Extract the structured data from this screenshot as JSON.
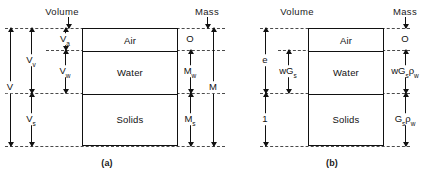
{
  "figure": {
    "caption_a": "(a)",
    "caption_b": "(b)"
  },
  "panel_a": {
    "header_volume": "Volume",
    "header_mass": "Mass",
    "phases": [
      {
        "name": "Air"
      },
      {
        "name": "Water"
      },
      {
        "name": "Solids"
      }
    ],
    "volume_labels": {
      "total": "V",
      "voids": "V",
      "voids_sub": "v",
      "air": "V",
      "air_sub": "a",
      "water": "V",
      "water_sub": "w",
      "solids": "V",
      "solids_sub": "s"
    },
    "mass_labels": {
      "air": "O",
      "water": "M",
      "water_sub": "w",
      "solids": "M",
      "solids_sub": "s",
      "total": "M"
    }
  },
  "panel_b": {
    "header_volume": "Volume",
    "header_mass": "Mass",
    "phases": [
      {
        "name": "Air"
      },
      {
        "name": "Water"
      },
      {
        "name": "Solids"
      }
    ],
    "volume_labels": {
      "voids": "e",
      "water": "wG",
      "water_sub": "s",
      "solids": "1"
    },
    "mass_labels": {
      "air": "O",
      "water_main": "wG",
      "water_sub1": "s",
      "water_rho": "ρ",
      "water_sub2": "w",
      "solids_main": "G",
      "solids_sub1": "s",
      "solids_rho": "ρ",
      "solids_sub2": "w"
    }
  },
  "colors": {
    "ink": "#111111",
    "chain": "#4a4a4a",
    "background": "#ffffff"
  }
}
